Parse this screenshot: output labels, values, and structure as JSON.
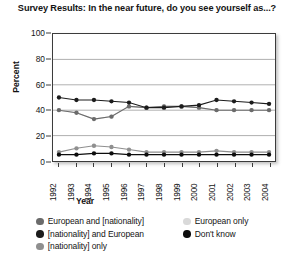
{
  "chart_data": {
    "type": "line",
    "title": "Survey Results: In the near future, do you see yourself as...?",
    "xlabel": "Year",
    "ylabel": "Percent",
    "ylim": [
      0,
      100
    ],
    "yticks": [
      0,
      20,
      40,
      60,
      80,
      100
    ],
    "grid": "horizontal",
    "legend_position": "bottom",
    "categories": [
      "1992",
      "1993",
      "1994",
      "1995",
      "1996",
      "1997",
      "1998",
      "1999",
      "2000",
      "2001",
      "2002",
      "2003",
      "2004"
    ],
    "series": [
      {
        "name": "European and [nationality]",
        "color": "#6b6b6b",
        "values": [
          40,
          38,
          33,
          35,
          43,
          42,
          43,
          43,
          42,
          40,
          40,
          40,
          40
        ]
      },
      {
        "name": "[nationality] and European",
        "color": "#1c1c1c",
        "values": [
          50,
          48,
          48,
          47,
          46,
          42,
          42,
          43,
          44,
          48,
          47,
          46,
          45
        ]
      },
      {
        "name": "[nationality] only",
        "color": "#8f8f8f",
        "values": [
          7,
          10,
          12,
          11,
          9,
          7,
          7,
          7,
          7,
          8,
          7,
          7,
          7
        ]
      },
      {
        "name": "European only",
        "color": "#d9d9d9",
        "values": [
          40,
          38,
          33,
          35,
          43,
          42,
          43,
          43,
          42,
          40,
          40,
          40,
          40
        ]
      },
      {
        "name": "Don't know",
        "color": "#0d0d0d",
        "values": [
          5,
          5,
          6,
          6,
          5,
          5,
          5,
          5,
          5,
          5,
          5,
          5,
          5
        ]
      }
    ],
    "legend": [
      {
        "label": "European and [nationality]",
        "color": "#6b6b6b",
        "column": "left"
      },
      {
        "label": "[nationality] and European",
        "color": "#1c1c1c",
        "column": "left"
      },
      {
        "label": "[nationality] only",
        "color": "#8f8f8f",
        "column": "left"
      },
      {
        "label": "European only",
        "color": "#d9d9d9",
        "column": "right"
      },
      {
        "label": "Don't know",
        "color": "#0d0d0d",
        "column": "right"
      }
    ]
  }
}
